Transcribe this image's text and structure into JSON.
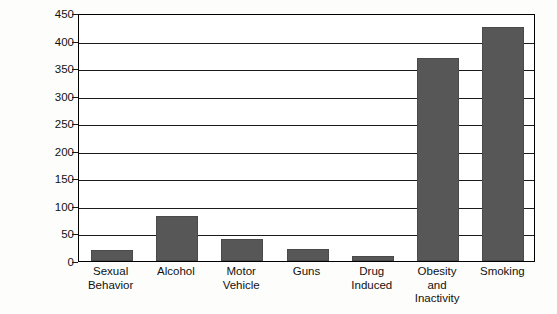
{
  "chart_data": {
    "type": "bar",
    "title": "",
    "xlabel": "",
    "ylabel": "No. of Deaths (thousands)",
    "ylim": [
      0,
      450
    ],
    "ytick_step": 50,
    "yticks": [
      0,
      50,
      100,
      150,
      200,
      250,
      300,
      350,
      400,
      450
    ],
    "ytick_labels": [
      "0",
      "50",
      "100",
      "150",
      "200",
      "250",
      "300",
      "350",
      "400",
      "450"
    ],
    "grid": true,
    "legend": "none",
    "bar_color": "#575757",
    "frame_color": "#000000",
    "background": "#ffffff",
    "categories": [
      "Sexual Behavior",
      "Alcohol",
      "Motor Vehicle",
      "Guns",
      "Drug Induced",
      "Obesity and Inactivity",
      "Smoking"
    ],
    "category_lines": [
      [
        "Sexual",
        "Behavior"
      ],
      [
        "Alcohol"
      ],
      [
        "Motor",
        "Vehicle"
      ],
      [
        "Guns"
      ],
      [
        "Drug",
        "Induced"
      ],
      [
        "Obesity",
        "and",
        "Inactivity"
      ],
      [
        "Smoking"
      ]
    ],
    "values": [
      20,
      82,
      40,
      22,
      10,
      368,
      425
    ]
  }
}
